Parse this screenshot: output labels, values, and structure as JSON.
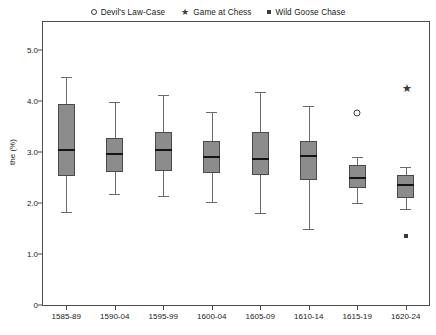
{
  "chart_data": {
    "type": "box",
    "title": "",
    "xlabel": "",
    "ylabel": "the (%)",
    "ylim": [
      0,
      5.4
    ],
    "yticks": [
      0,
      1.0,
      2.0,
      3.0,
      4.0,
      5.0
    ],
    "ytick_labels": [
      "0",
      "1.0",
      "2.0",
      "3.0",
      "4.0",
      "5.0"
    ],
    "grid": false,
    "legend_position": "top-center",
    "categories": [
      "1585-89",
      "1590-04",
      "1595-99",
      "1600-04",
      "1605-09",
      "1610-14",
      "1615-19",
      "1620-24"
    ],
    "boxes": [
      {
        "category": "1585-89",
        "whisker_low": 1.82,
        "q1": 2.53,
        "median": 3.04,
        "q3": 3.94,
        "whisker_high": 4.47
      },
      {
        "category": "1590-04",
        "whisker_low": 2.18,
        "q1": 2.61,
        "median": 2.96,
        "q3": 3.27,
        "whisker_high": 3.98
      },
      {
        "category": "1595-99",
        "whisker_low": 2.14,
        "q1": 2.63,
        "median": 3.04,
        "q3": 3.39,
        "whisker_high": 4.12
      },
      {
        "category": "1600-04",
        "whisker_low": 2.02,
        "q1": 2.59,
        "median": 2.9,
        "q3": 3.22,
        "whisker_high": 3.78
      },
      {
        "category": "1605-09",
        "whisker_low": 1.8,
        "q1": 2.55,
        "median": 2.86,
        "q3": 3.39,
        "whisker_high": 4.18
      },
      {
        "category": "1610-14",
        "whisker_low": 1.49,
        "q1": 2.45,
        "median": 2.92,
        "q3": 3.22,
        "whisker_high": 3.9
      },
      {
        "category": "1615-19",
        "whisker_low": 2.0,
        "q1": 2.29,
        "median": 2.49,
        "q3": 2.75,
        "whisker_high": 2.9
      },
      {
        "category": "1620-24",
        "whisker_low": 1.88,
        "q1": 2.1,
        "median": 2.35,
        "q3": 2.55,
        "whisker_high": 2.71
      }
    ],
    "outliers": [
      {
        "category": "1615-19",
        "value": 3.76,
        "series": "Devil's Law-Case",
        "marker": "circle"
      },
      {
        "category": "1620-24",
        "value": 4.27,
        "series": "Game at Chess",
        "marker": "star"
      },
      {
        "category": "1620-24",
        "value": 1.35,
        "series": "Wild Goose Chase",
        "marker": "square"
      }
    ],
    "legend": [
      {
        "label": "Devil's Law-Case",
        "marker": "circle"
      },
      {
        "label": "Game at Chess",
        "marker": "star"
      },
      {
        "label": "Wild Goose Chase",
        "marker": "square"
      }
    ],
    "colors": {
      "box_fill": "#8c8c8c",
      "box_edge": "#4a4a4a",
      "median": "#141414",
      "whisker": "#6b6b6b",
      "marker": "#3a3a3a",
      "frame": "#4d4d4d"
    }
  }
}
